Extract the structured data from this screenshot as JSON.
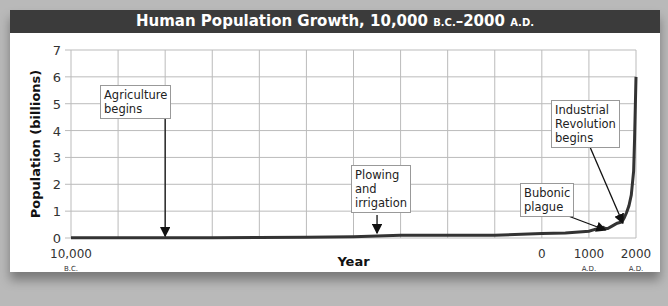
{
  "chart_data": {
    "type": "line",
    "title": "Human Population Growth, 10,000 B.C.–2000 A.D.",
    "title_parts": {
      "main": "Human Population Growth, 10,000 ",
      "bc": "B.C.",
      "dash": "–2000 ",
      "ad": "A.D."
    },
    "xlabel": "Year",
    "ylabel": "Population (billions)",
    "ylim": [
      0,
      7
    ],
    "yticks": [
      0,
      1,
      2,
      3,
      4,
      5,
      6,
      7
    ],
    "xlim": [
      -10000,
      2000
    ],
    "xtick_labels": [
      {
        "x": -10000,
        "label": "10,000",
        "era": "B.C."
      },
      {
        "x": 0,
        "label": "0",
        "era": ""
      },
      {
        "x": 1000,
        "label": "1000",
        "era": "A.D."
      },
      {
        "x": 2000,
        "label": "2000",
        "era": "A.D."
      }
    ],
    "grid": true,
    "grid_x_step": 1000,
    "series": [
      {
        "name": "World population",
        "x": [
          -10000,
          -8000,
          -7000,
          -6000,
          -5000,
          -4000,
          -3000,
          -2000,
          -1000,
          0,
          500,
          1000,
          1200,
          1300,
          1350,
          1400,
          1500,
          1600,
          1700,
          1750,
          1800,
          1850,
          1900,
          1950,
          1970,
          2000
        ],
        "values": [
          0.005,
          0.006,
          0.01,
          0.02,
          0.03,
          0.05,
          0.1,
          0.1,
          0.1,
          0.17,
          0.19,
          0.25,
          0.36,
          0.4,
          0.35,
          0.35,
          0.45,
          0.55,
          0.6,
          0.75,
          0.95,
          1.2,
          1.6,
          2.5,
          3.7,
          6.0
        ]
      }
    ],
    "annotations": [
      {
        "text": "Agriculture begins",
        "lines": [
          "Agriculture",
          "begins"
        ],
        "x": -8000
      },
      {
        "text": "Plowing and irrigation",
        "lines": [
          "Plowing",
          "and",
          "irrigation"
        ],
        "x": -3500
      },
      {
        "text": "Bubonic plague",
        "lines": [
          "Bubonic",
          "plague"
        ],
        "x": 1350
      },
      {
        "text": "Industrial Revolution begins",
        "lines": [
          "Industrial",
          "Revolution",
          "begins"
        ],
        "x": 1750
      }
    ]
  }
}
